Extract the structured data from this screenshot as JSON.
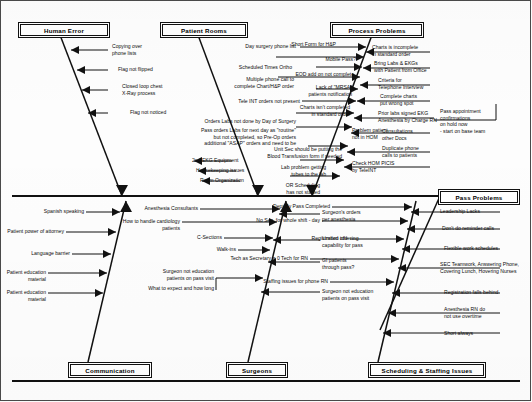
{
  "diagram": {
    "type": "fishbone-ishikawa",
    "title": "",
    "categories_top": [
      {
        "id": "human-error",
        "label": "Human Error"
      },
      {
        "id": "patient-rooms",
        "label": "Patient Rooms"
      },
      {
        "id": "process-problems",
        "label": "Process Problems"
      },
      {
        "id": "pass-problems",
        "label": "Pass Problems"
      }
    ],
    "categories_bottom": [
      {
        "id": "communication",
        "label": "Communication"
      },
      {
        "id": "surgeons",
        "label": "Surgeons"
      },
      {
        "id": "scheduling-staffing",
        "label": "Scheduling & Staffing Issues"
      }
    ],
    "causes": {
      "human_error": [
        "Copying over\nphone lists",
        "Flag not flipped",
        "Closed loop chest\nX-Ray process",
        "Flag not noticed"
      ],
      "patient_rooms": [
        "2nd EKG Equipment",
        "Housekeeping issues",
        "Room Organization"
      ],
      "process_left": [
        "Day surgery phone list",
        "Scheduled Times Ortho",
        "Multiple phone call to\ncomplete Chart/H&P order",
        "Tele INT orders not present",
        "Orders Labs not done by Day of Surgery",
        "Pass orders Labs for next day as \"routine\"\nbut not completed, so Pre-Op orders\nadditional \"ASAP\" orders and need to be",
        "Unit Sec should be putting the\nBlood Transfusion form if needed",
        "Lab problem getting\ntubes to the lab",
        "OR Scheduling\nhas not started"
      ],
      "process_inner": [
        "Short Form for H&P",
        "Mobile Pass?",
        "EOD add on not complete",
        "Lack of \"MRSA\"\npatients notification",
        "Charts isn't completed\nin standard order",
        "Problem patient\nnot in HOM",
        "Check HOM PICIS\nby TeleINT"
      ],
      "process_right": [
        "Charts is incomplete\nin standard order",
        "Bring Labs & EKGs\nwith Patient from Office",
        "Criteria for\nTelephone Interview",
        "Complete charts\nput wrong spot",
        "Prior labs signed EKG\nAnesthesia by Charge RN",
        "Consultations\nother Docs",
        "Duplicate phone\ncalls to patients"
      ],
      "process_note": "Pass appointment\nconfirmations\non hold now\n- start on base team",
      "communication": [
        "Spanish speaking",
        "Patient power of attorney",
        "Language barrier",
        "Patient education material",
        "Patient education material"
      ],
      "surgeons_left": [
        "Anesthesia Consultants",
        "How to handle cardiology patients",
        "C-Sections",
        "Walk-ins",
        "Surgeon not education\npatients on pass visit",
        "What to expect and how long"
      ],
      "surgeons_right": [
        "Surgeon's orders\nper anesthesia",
        "Limited ordering\ncapability for pass",
        "GI patients\nthrough pass?",
        "Surgeon not education\npatients on pass visit"
      ],
      "scheduling_left": [
        "Dept By Pass Completed",
        "No Sec. for whole shift - day",
        "Registration idle",
        "Tech as Secretary = 0 Tech for RN",
        "Staffing issues for phone RN"
      ],
      "scheduling_right": [
        "Leadership Lacks",
        "Don't do reminder calls",
        "Flexible work schedules",
        "SEC Teamwork, Answering Phone,\nCovering Lunch, Hovering Nurses",
        "Registration falls behind",
        "Anesthesia RN do\nnot use overtime",
        "Short always"
      ]
    },
    "colors": {
      "ink": "#111111",
      "background": "#ffffff",
      "frame": "#4a4a4a"
    }
  }
}
